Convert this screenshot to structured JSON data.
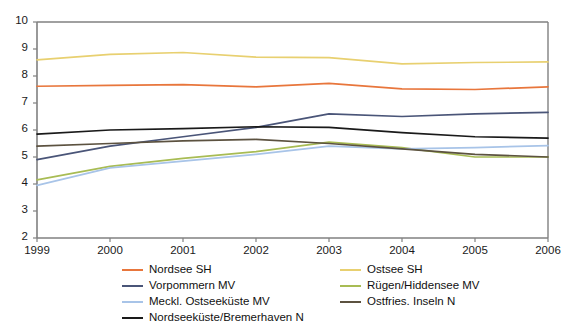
{
  "chart_data": {
    "type": "line",
    "title": "",
    "subtitle": "",
    "xlabel": "",
    "ylabel": "",
    "x": [
      "1999",
      "2000",
      "2001",
      "2002",
      "2003",
      "2004",
      "2005",
      "2006"
    ],
    "xlim": [
      1999,
      2006
    ],
    "ylim": [
      2,
      10
    ],
    "yticks": [
      "2",
      "3",
      "4",
      "5",
      "6",
      "7",
      "8",
      "9",
      "10"
    ],
    "grid": false,
    "legend_position": "bottom",
    "series": [
      {
        "name": "Nordsee SH",
        "color": "#e8763c",
        "values": [
          7.62,
          7.65,
          7.68,
          7.6,
          7.73,
          7.52,
          7.5,
          7.6
        ]
      },
      {
        "name": "Ostsee SH",
        "color": "#e8d070",
        "values": [
          8.6,
          8.8,
          8.87,
          8.7,
          8.68,
          8.45,
          8.5,
          8.52
        ]
      },
      {
        "name": "Vorpommern MV",
        "color": "#4a5578",
        "values": [
          4.9,
          5.4,
          5.75,
          6.1,
          6.6,
          6.5,
          6.6,
          6.65
        ]
      },
      {
        "name": "Rügen/Hiddensee MV",
        "color": "#a8bc54",
        "values": [
          4.15,
          4.65,
          4.95,
          5.2,
          5.55,
          5.35,
          5.0,
          5.0
        ]
      },
      {
        "name": "Meckl. Ostseeküste MV",
        "color": "#a8c4e8",
        "values": [
          3.95,
          4.6,
          4.85,
          5.1,
          5.4,
          5.3,
          5.35,
          5.42
        ]
      },
      {
        "name": "Ostfries. Inseln N",
        "color": "#5c5240",
        "values": [
          5.4,
          5.5,
          5.6,
          5.65,
          5.5,
          5.3,
          5.1,
          5.0
        ]
      },
      {
        "name": "Nordseeküste/Bremerhaven N",
        "color": "#1a1a1a",
        "values": [
          5.85,
          6.0,
          6.05,
          6.12,
          6.1,
          5.9,
          5.75,
          5.7
        ]
      }
    ]
  },
  "axes": {
    "y_ticks": [
      "10",
      "9",
      "8",
      "7",
      "6",
      "5",
      "4",
      "3",
      "2"
    ],
    "x_ticks": [
      "1999",
      "2000",
      "2001",
      "2002",
      "2003",
      "2004",
      "2005",
      "2006"
    ]
  },
  "legend": {
    "left_column": [
      {
        "label": "Nordsee SH",
        "color": "#e8763c"
      },
      {
        "label": "Vorpommern MV",
        "color": "#4a5578"
      },
      {
        "label": "Meckl. Ostseeküste MV",
        "color": "#a8c4e8"
      },
      {
        "label": "Nordseeküste/Bremerhaven N",
        "color": "#1a1a1a"
      }
    ],
    "right_column": [
      {
        "label": "Ostsee SH",
        "color": "#e8d070"
      },
      {
        "label": "Rügen/Hiddensee MV",
        "color": "#a8bc54"
      },
      {
        "label": "Ostfries. Inseln N",
        "color": "#5c5240"
      }
    ]
  },
  "style": {
    "axis_color": "#808080",
    "plot_background": "#ffffff",
    "text_color": "#1a1a1a"
  }
}
